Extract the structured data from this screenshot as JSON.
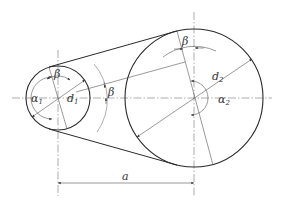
{
  "diagram": {
    "type": "belt-drive-geometry",
    "colors": {
      "background": "#ffffff",
      "outline": "#2a2a2a",
      "thin_line": "#555555",
      "centerline": "#777777",
      "text": "#333333"
    },
    "small_pulley": {
      "center": [
        58,
        98
      ],
      "radius": 32,
      "diameter_label": "d",
      "diameter_sub": "1",
      "wrap_angle_label": "α",
      "wrap_angle_sub": "1",
      "angle_beta_label": "β"
    },
    "large_pulley": {
      "center": [
        194,
        98
      ],
      "radius": 69,
      "diameter_label": "d",
      "diameter_sub": "2",
      "wrap_angle_label": "α",
      "wrap_angle_sub": "2",
      "angle_beta_label": "β"
    },
    "middle_angle_label": "β",
    "center_distance_label": "a"
  }
}
